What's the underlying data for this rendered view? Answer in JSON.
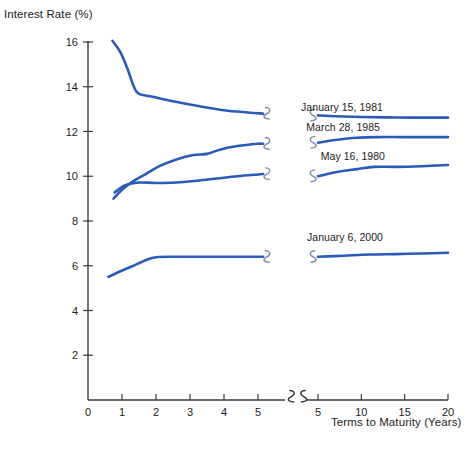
{
  "chart_data": {
    "type": "line",
    "title": "",
    "ylabel": "Interest Rate (%)",
    "xlabel": "Terms to Maturity (Years)",
    "ylim": [
      0,
      16
    ],
    "y_ticks": [
      0,
      2,
      4,
      6,
      8,
      10,
      12,
      14,
      16
    ],
    "y_tick_labels": [
      "0",
      "2",
      "4",
      "6",
      "8",
      "10",
      "12",
      "14",
      "16"
    ],
    "x_axis_broken": true,
    "x_segment_left": {
      "range": [
        0,
        5.4
      ],
      "ticks": [
        0,
        1,
        2,
        3,
        4,
        5
      ],
      "tick_labels": [
        "0",
        "1",
        "2",
        "3",
        "4",
        "5"
      ]
    },
    "x_segment_right": {
      "range": [
        4.6,
        20
      ],
      "ticks": [
        5,
        10,
        15,
        20
      ],
      "tick_labels": [
        "5",
        "10",
        "15",
        "20"
      ]
    },
    "grid": false,
    "legend_position": "inline-right-of-curves",
    "line_color": "#2B5BB8",
    "series": [
      {
        "name": "January 15, 1981",
        "label": "January 15, 1981",
        "left_points": [
          [
            0.72,
            16.05
          ],
          [
            0.95,
            15.55
          ],
          [
            1.15,
            14.85
          ],
          [
            1.35,
            14.0
          ],
          [
            1.5,
            13.68
          ],
          [
            1.9,
            13.55
          ],
          [
            2.5,
            13.35
          ],
          [
            3.2,
            13.15
          ],
          [
            4.0,
            12.95
          ],
          [
            4.7,
            12.85
          ],
          [
            5.15,
            12.8
          ]
        ],
        "right_points": [
          [
            5.0,
            12.72
          ],
          [
            7.0,
            12.68
          ],
          [
            10.0,
            12.65
          ],
          [
            13.0,
            12.63
          ],
          [
            16.0,
            12.62
          ],
          [
            20.0,
            12.62
          ]
        ]
      },
      {
        "name": "March 28, 1985",
        "label": "March 28, 1985",
        "left_points": [
          [
            0.75,
            9.0
          ],
          [
            1.0,
            9.4
          ],
          [
            1.3,
            9.75
          ],
          [
            1.7,
            10.1
          ],
          [
            2.1,
            10.45
          ],
          [
            2.6,
            10.75
          ],
          [
            3.1,
            10.95
          ],
          [
            3.5,
            11.0
          ],
          [
            3.9,
            11.2
          ],
          [
            4.4,
            11.35
          ],
          [
            5.0,
            11.45
          ],
          [
            5.15,
            11.45
          ]
        ],
        "right_points": [
          [
            5.0,
            11.5
          ],
          [
            7.0,
            11.62
          ],
          [
            9.5,
            11.72
          ],
          [
            12.0,
            11.75
          ],
          [
            15.0,
            11.75
          ],
          [
            20.0,
            11.75
          ]
        ]
      },
      {
        "name": "May 16, 1980",
        "label": "May 16, 1980",
        "left_points": [
          [
            0.78,
            9.28
          ],
          [
            1.1,
            9.6
          ],
          [
            1.5,
            9.72
          ],
          [
            2.0,
            9.7
          ],
          [
            2.6,
            9.72
          ],
          [
            3.2,
            9.8
          ],
          [
            3.8,
            9.9
          ],
          [
            4.4,
            10.0
          ],
          [
            5.0,
            10.08
          ],
          [
            5.15,
            10.1
          ]
        ],
        "right_points": [
          [
            5.0,
            10.0
          ],
          [
            7.0,
            10.18
          ],
          [
            9.5,
            10.32
          ],
          [
            11.5,
            10.42
          ],
          [
            14.0,
            10.42
          ],
          [
            17.0,
            10.45
          ],
          [
            20.0,
            10.5
          ]
        ]
      },
      {
        "name": "January 6, 2000",
        "label": "January 6, 2000",
        "left_points": [
          [
            0.6,
            5.5
          ],
          [
            0.9,
            5.72
          ],
          [
            1.3,
            5.98
          ],
          [
            1.7,
            6.25
          ],
          [
            2.0,
            6.38
          ],
          [
            2.6,
            6.4
          ],
          [
            3.3,
            6.4
          ],
          [
            4.0,
            6.4
          ],
          [
            4.7,
            6.4
          ],
          [
            5.15,
            6.4
          ]
        ],
        "right_points": [
          [
            5.0,
            6.4
          ],
          [
            8.0,
            6.45
          ],
          [
            11.0,
            6.5
          ],
          [
            14.0,
            6.52
          ],
          [
            17.0,
            6.55
          ],
          [
            20.0,
            6.58
          ]
        ]
      }
    ],
    "series_labels": [
      {
        "text": "January 15, 1981",
        "x": 383,
        "y": 113
      },
      {
        "text": "March 28, 1985",
        "x": 380,
        "y": 133
      },
      {
        "text": "May 16, 1980",
        "x": 385,
        "y": 162
      },
      {
        "text": "January 6, 2000",
        "x": 383,
        "y": 243
      }
    ],
    "axis_breaks": [
      {
        "name": "x-axis-break-left",
        "x": 289,
        "y": 401
      },
      {
        "name": "x-axis-break-right",
        "x": 303,
        "y": 401
      }
    ]
  }
}
